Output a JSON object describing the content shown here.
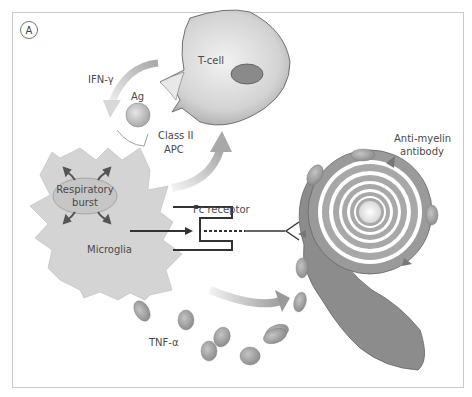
{
  "figure": {
    "panel_label": "A",
    "labels": {
      "t_cell": "T-cell",
      "ifn_gamma": "IFN-γ",
      "ag": "Ag",
      "class_ii": "Class II",
      "apc": "APC",
      "respiratory": "Respiratory",
      "burst": "burst",
      "microglia": "Microglia",
      "fc_receptor": "Fc receptor",
      "anti_myelin": "Anti-myelin",
      "antibody": "antibody",
      "tnf_alpha": "TNF-α"
    },
    "colors": {
      "frame": "#c9c9c9",
      "microglia_fill": "#d4d4d4",
      "tcell_fill": "#cfcfcf",
      "tcell_nucleus": "#8a8a8a",
      "myelin_dark": "#8c8c8c",
      "myelin_light": "#b4b4b4",
      "arrow_gray": "#bdbdbd",
      "line": "#333333",
      "text": "#4a4a4a"
    }
  }
}
